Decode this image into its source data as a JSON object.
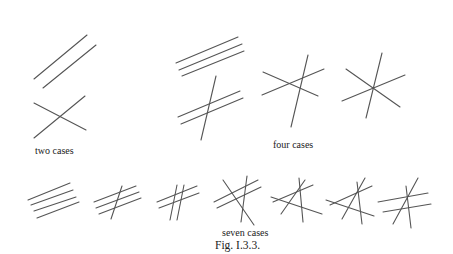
{
  "figure": {
    "caption": "Fig. I.3.3.",
    "stroke_color": "#555555",
    "background": "#ffffff"
  },
  "groups": [
    {
      "label": "two cases",
      "label_pos": [
        35,
        150
      ],
      "cases": [
        {
          "name": "two-parallel",
          "lines": [
            [
              34,
              79,
              87,
              35
            ],
            [
              43,
              88,
              96,
              45
            ]
          ]
        },
        {
          "name": "two-intersecting",
          "lines": [
            [
              34,
              103,
              86,
              130
            ],
            [
              34,
              138,
              85,
              96
            ]
          ]
        }
      ]
    },
    {
      "label": "four cases",
      "label_pos": [
        272,
        144
      ],
      "cases": [
        {
          "name": "three-parallel",
          "lines": [
            [
              176,
              63,
              238,
              37
            ],
            [
              179,
              70,
              242,
              44
            ],
            [
              182,
              76,
              244,
              51
            ]
          ]
        },
        {
          "name": "two-parallel-one-transversal",
          "lines": [
            [
              178,
              117,
              240,
              91
            ],
            [
              181,
              124,
              243,
              98
            ],
            [
              201,
              140,
              216,
              76
            ]
          ]
        },
        {
          "name": "three-general-position",
          "lines": [
            [
              263,
              72,
              318,
              96
            ],
            [
              262,
              95,
              324,
              69
            ],
            [
              291,
              127,
              308,
              55
            ]
          ]
        },
        {
          "name": "three-concurrent",
          "lines": [
            [
              346,
              69,
              400,
              107
            ],
            [
              342,
              101,
              405,
              75
            ],
            [
              366,
              118,
              382,
              53
            ]
          ]
        }
      ]
    },
    {
      "label": "seven cases",
      "label_pos": [
        223,
        233
      ],
      "cases": [
        {
          "name": "four-parallel",
          "lines": [
            [
              28,
              200,
              70,
              183
            ],
            [
              31,
              205,
              73,
              190
            ],
            [
              34,
              211,
              76,
              197
            ],
            [
              37,
              218,
              79,
              202
            ]
          ]
        },
        {
          "name": "three-parallel-one-transversal",
          "lines": [
            [
              94,
              202,
              136,
              186
            ],
            [
              96,
              208,
              139,
              192
            ],
            [
              99,
              214,
              141,
              198
            ],
            [
              111,
              219,
              122,
              186
            ]
          ]
        },
        {
          "name": "two-pairs-parallel",
          "lines": [
            [
              157,
              202,
              197,
              186
            ],
            [
              159,
              208,
              199,
              193
            ],
            [
              170,
              220,
              177,
              185
            ],
            [
              177,
              220,
              184,
              185
            ]
          ]
        },
        {
          "name": "two-parallel-two-general",
          "lines": [
            [
              214,
              202,
              258,
              180
            ],
            [
              217,
              208,
              261,
              187
            ],
            [
              223,
              180,
              254,
              225
            ],
            [
              247,
              176,
              241,
              222
            ]
          ]
        },
        {
          "name": "two-concurrent-triple",
          "lines": [
            [
              271,
              197,
              322,
              214
            ],
            [
              273,
              202,
              313,
              185
            ],
            [
              281,
              214,
              305,
              180
            ],
            [
              299,
              178,
              303,
              222
            ]
          ]
        },
        {
          "name": "three-concurrent-one-general",
          "lines": [
            [
              326,
              200,
              374,
              216
            ],
            [
              330,
              205,
              372,
              186
            ],
            [
              342,
              219,
              365,
              178
            ],
            [
              357,
              182,
              362,
              224
            ]
          ]
        },
        {
          "name": "concurrent-with-parallel-pair",
          "lines": [
            [
              378,
              202,
              428,
              193
            ],
            [
              383,
              212,
              431,
              204
            ],
            [
              393,
              224,
              418,
              178
            ],
            [
              406,
              186,
              411,
              228
            ]
          ]
        }
      ]
    }
  ],
  "labels": [
    {
      "id": "two-cases-label",
      "text": "two cases",
      "x": 35,
      "y": 146,
      "cls": "small"
    },
    {
      "id": "four-cases-label",
      "text": "four cases",
      "x": 273,
      "y": 140,
      "cls": "small"
    },
    {
      "id": "seven-cases-label",
      "text": "seven cases",
      "x": 222,
      "y": 228,
      "cls": "small"
    },
    {
      "id": "figure-caption",
      "text": "Fig. I.3.3.",
      "x": 215,
      "y": 240,
      "cls": "caption"
    }
  ]
}
